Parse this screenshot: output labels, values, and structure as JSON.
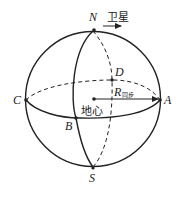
{
  "diagram": {
    "type": "celestial-sphere-orbit",
    "labels": {
      "north": "N",
      "south": "S",
      "point_a": "A",
      "point_b": "B",
      "point_c": "C",
      "point_d": "D",
      "satellite": "卫星",
      "earth_center": "地心",
      "radius_symbol": "R",
      "radius_subscript": "同步"
    },
    "colors": {
      "stroke": "#222222",
      "background": "#ffffff"
    }
  }
}
